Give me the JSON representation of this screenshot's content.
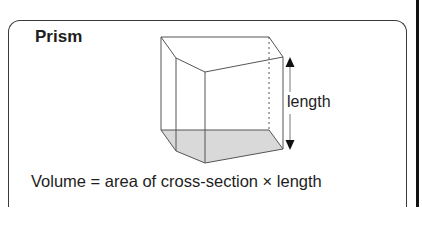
{
  "title": "Prism",
  "dimension_label": "length",
  "formula": "Volume = area of cross-section × length",
  "colors": {
    "text": "#1e1e1e",
    "edge": "#555555",
    "border": "#3a3a3a",
    "base_fill": "#d9d9d9",
    "arrow": "#111111"
  }
}
